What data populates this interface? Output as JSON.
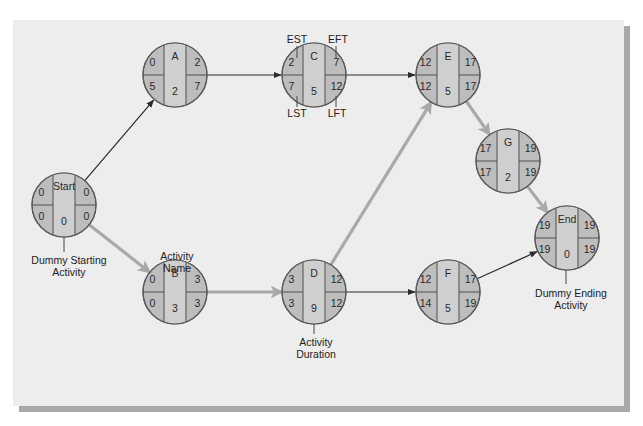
{
  "diagram": {
    "type": "activity-on-node network (critical path)",
    "colors": {
      "background": "#ededed",
      "node_fill": "#bdbdbd",
      "node_center_fill": "#cfcfcf",
      "node_stroke": "#5a5a5a",
      "normal_arrow": "#2a2a2a",
      "critical_arrow": "#a9a9a9"
    },
    "nodes": [
      {
        "id": "start",
        "name": "Start",
        "est": "0",
        "eft": "0",
        "lst": "0",
        "lft": "0",
        "duration": "0",
        "cx": 64,
        "cy": 205
      },
      {
        "id": "a",
        "name": "A",
        "est": "0",
        "eft": "2",
        "lst": "5",
        "lft": "7",
        "duration": "2",
        "cx": 175,
        "cy": 75
      },
      {
        "id": "b",
        "name": "B",
        "est": "0",
        "eft": "3",
        "lst": "0",
        "lft": "3",
        "duration": "3",
        "cx": 175,
        "cy": 292
      },
      {
        "id": "c",
        "name": "C",
        "est": "2",
        "eft": "7",
        "lst": "7",
        "lft": "12",
        "duration": "5",
        "cx": 314,
        "cy": 75
      },
      {
        "id": "d",
        "name": "D",
        "est": "3",
        "eft": "12",
        "lst": "3",
        "lft": "12",
        "duration": "9",
        "cx": 314,
        "cy": 292
      },
      {
        "id": "e",
        "name": "E",
        "est": "12",
        "eft": "17",
        "lst": "12",
        "lft": "17",
        "duration": "5",
        "cx": 448,
        "cy": 75
      },
      {
        "id": "f",
        "name": "F",
        "est": "12",
        "eft": "17",
        "lst": "14",
        "lft": "19",
        "duration": "5",
        "cx": 448,
        "cy": 292
      },
      {
        "id": "g",
        "name": "G",
        "est": "17",
        "eft": "19",
        "lst": "17",
        "lft": "19",
        "duration": "2",
        "cx": 508,
        "cy": 161
      },
      {
        "id": "end",
        "name": "End",
        "est": "19",
        "eft": "19",
        "lst": "19",
        "lft": "19",
        "duration": "0",
        "cx": 567,
        "cy": 238
      }
    ],
    "edges": [
      {
        "from": "start",
        "to": "a",
        "critical": false
      },
      {
        "from": "start",
        "to": "b",
        "critical": true
      },
      {
        "from": "a",
        "to": "c",
        "critical": false
      },
      {
        "from": "c",
        "to": "e",
        "critical": false
      },
      {
        "from": "b",
        "to": "d",
        "critical": true
      },
      {
        "from": "d",
        "to": "e",
        "critical": true
      },
      {
        "from": "d",
        "to": "f",
        "critical": false
      },
      {
        "from": "e",
        "to": "g",
        "critical": true
      },
      {
        "from": "g",
        "to": "end",
        "critical": true
      },
      {
        "from": "f",
        "to": "end",
        "critical": false
      }
    ],
    "annotations": {
      "est": "EST",
      "eft": "EFT",
      "lst": "LST",
      "lft": "LFT",
      "activity_name_line1": "Activity",
      "activity_name_line2": "Name",
      "activity_duration_line1": "Activity",
      "activity_duration_line2": "Duration",
      "dummy_start_line1": "Dummy Starting",
      "dummy_start_line2": "Activity",
      "dummy_end_line1": "Dummy Ending",
      "dummy_end_line2": "Activity"
    }
  }
}
